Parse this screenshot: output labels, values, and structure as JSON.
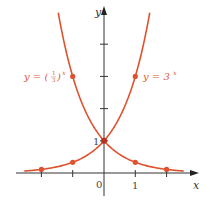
{
  "chart_data": {
    "type": "line",
    "title": "",
    "xlabel": "x",
    "ylabel": "y",
    "xlim": [
      -2.1,
      3
    ],
    "ylim": [
      -0.4,
      5.1
    ],
    "grid": false,
    "legend_position": "inline",
    "x_tick_labels": [
      {
        "value": 0,
        "label": "0"
      },
      {
        "value": 1,
        "label": "1"
      }
    ],
    "y_tick_labels": [
      {
        "value": 1,
        "label": "1"
      }
    ],
    "x_ticks": [
      -2,
      -1,
      0,
      1,
      2
    ],
    "y_ticks": [
      1,
      2,
      3,
      4
    ],
    "series": [
      {
        "name": "y = 3^x",
        "label_main": "y = 3",
        "label_exp": "x",
        "color": "#e0522f",
        "function": "3^x",
        "points": [
          {
            "x": -2,
            "y": 0.111
          },
          {
            "x": -1,
            "y": 0.333
          },
          {
            "x": 0,
            "y": 1
          },
          {
            "x": 1,
            "y": 3
          }
        ]
      },
      {
        "name": "y = (1/3)^x",
        "label_main": "y = (",
        "label_frac_num": "1",
        "label_frac_den": "3",
        "label_close": ")",
        "label_exp": "x",
        "color": "#e0522f",
        "function": "(1/3)^x",
        "points": [
          {
            "x": -1,
            "y": 3
          },
          {
            "x": 0,
            "y": 1
          },
          {
            "x": 1,
            "y": 0.333
          },
          {
            "x": 2,
            "y": 0.111
          }
        ]
      }
    ]
  },
  "axes": {
    "x_label": "x",
    "y_label": "y",
    "origin_label": "0",
    "x_one_label": "1",
    "y_one_label": "1"
  },
  "colors": {
    "curve": "#e0522f",
    "label": "#d9583a",
    "axis": "#333333"
  }
}
